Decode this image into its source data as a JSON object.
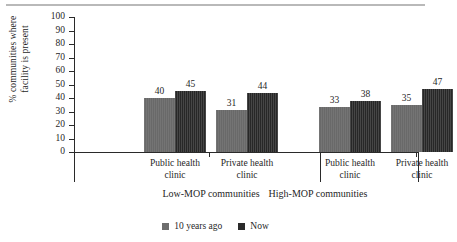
{
  "chart_data": {
    "type": "bar",
    "title": "",
    "xlabel": "",
    "ylabel_line1": "% communities where",
    "ylabel_line2": "facility is present",
    "ylim": [
      0,
      100
    ],
    "yticks": [
      100,
      90,
      80,
      70,
      60,
      50,
      40,
      30,
      20,
      10,
      0
    ],
    "grid": false,
    "legend_position": "bottom-center",
    "categories": [
      "Public health clinic",
      "Private health clinic",
      "Public health clinic",
      "Private health clinic"
    ],
    "category_lines": [
      [
        "Public health",
        "clinic"
      ],
      [
        "Private health",
        "clinic"
      ],
      [
        "Public health",
        "clinic"
      ],
      [
        "Private health",
        "clinic"
      ]
    ],
    "groups": [
      {
        "label": "Low-MOP communities",
        "categories": [
          "Public health clinic",
          "Private health clinic"
        ]
      },
      {
        "label": "High-MOP communities",
        "categories": [
          "Public health clinic",
          "Private health clinic"
        ]
      }
    ],
    "series": [
      {
        "name": "10 years ago",
        "color": "#6d6d6d",
        "values": [
          40,
          31,
          33,
          35
        ]
      },
      {
        "name": "Now",
        "color": "#2b2b2b",
        "values": [
          45,
          44,
          38,
          47
        ]
      }
    ]
  },
  "legend": {
    "items": [
      {
        "label": "10 years ago",
        "swatch": "gray-square-swatch"
      },
      {
        "label": "Now",
        "swatch": "black-square-swatch"
      }
    ]
  }
}
